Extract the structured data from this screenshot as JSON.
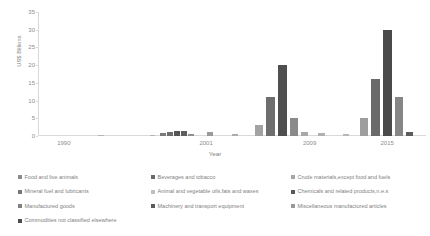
{
  "chart_data": {
    "type": "bar",
    "title": "",
    "xlabel": "Year",
    "ylabel": "US$ Billions",
    "ylim": [
      0,
      35
    ],
    "yticks": [
      0,
      5,
      10,
      15,
      20,
      25,
      30,
      35
    ],
    "xticks": [
      "1990",
      "2001",
      "2009",
      "2015"
    ],
    "xtick_years": [
      1990,
      2001,
      2009,
      2015
    ],
    "x_range": [
      1988,
      2018
    ],
    "grid": false,
    "legend_position": "bottom",
    "series": [
      {
        "name": "Food and live animals",
        "color": "#8c8c8c"
      },
      {
        "name": "Beverages and tobacco",
        "color": "#6b6b6b"
      },
      {
        "name": "Crude materials,except food and fuels",
        "color": "#a6a6a6"
      },
      {
        "name": "Mineral fuel and lubricants",
        "color": "#767676"
      },
      {
        "name": "Animal and vegetable oils,fats and waxes",
        "color": "#bfbfbf"
      },
      {
        "name": "Chemicals and related products,n.e.s",
        "color": "#595959"
      },
      {
        "name": "Manufactured goods",
        "color": "#808080"
      },
      {
        "name": "Machinery and transport equipment",
        "color": "#5a5a5a"
      },
      {
        "name": "Miscellaneous manufactured articles",
        "color": "#999999"
      },
      {
        "name": "Commodities not classified elsewhere",
        "color": "#4d4d4d"
      }
    ],
    "bars": [
      {
        "x": 98,
        "w": 6,
        "v": 0.25,
        "color": "#b3b3b3"
      },
      {
        "x": 150,
        "w": 5,
        "v": 0.3,
        "color": "#b3b3b3"
      },
      {
        "x": 160,
        "w": 6,
        "v": 0.9,
        "color": "#7a7a7a"
      },
      {
        "x": 167,
        "w": 6,
        "v": 1.0,
        "color": "#6e6e6e"
      },
      {
        "x": 174,
        "w": 6,
        "v": 1.5,
        "color": "#565656"
      },
      {
        "x": 181,
        "w": 6,
        "v": 1.3,
        "color": "#5e5e5e"
      },
      {
        "x": 188,
        "w": 6,
        "v": 0.7,
        "color": "#8f8f8f"
      },
      {
        "x": 207,
        "w": 6,
        "v": 1.1,
        "color": "#9a9a9a"
      },
      {
        "x": 232,
        "w": 6,
        "v": 0.6,
        "color": "#ababab"
      },
      {
        "x": 255,
        "w": 8,
        "v": 3.0,
        "color": "#a3a3a3"
      },
      {
        "x": 266,
        "w": 9,
        "v": 11.0,
        "color": "#6e6e6e"
      },
      {
        "x": 278,
        "w": 9,
        "v": 20.0,
        "color": "#4f4f4f"
      },
      {
        "x": 290,
        "w": 8,
        "v": 5.0,
        "color": "#8a8a8a"
      },
      {
        "x": 301,
        "w": 7,
        "v": 1.0,
        "color": "#a8a8a8"
      },
      {
        "x": 318,
        "w": 7,
        "v": 0.8,
        "color": "#b0b0b0"
      },
      {
        "x": 343,
        "w": 6,
        "v": 0.45,
        "color": "#b8b8b8"
      },
      {
        "x": 360,
        "w": 8,
        "v": 5.0,
        "color": "#9e9e9e"
      },
      {
        "x": 371,
        "w": 9,
        "v": 16.0,
        "color": "#6a6a6a"
      },
      {
        "x": 383,
        "w": 9,
        "v": 30.0,
        "color": "#4a4a4a"
      },
      {
        "x": 395,
        "w": 8,
        "v": 11.0,
        "color": "#868686"
      },
      {
        "x": 406,
        "w": 7,
        "v": 1.2,
        "color": "#5c5c5c"
      }
    ]
  }
}
